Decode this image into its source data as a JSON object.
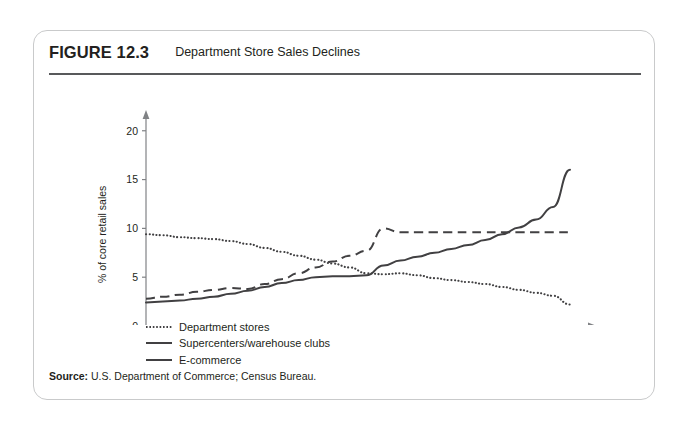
{
  "figure": {
    "number": "FIGURE 12.3",
    "title": "Department Store Sales Declines",
    "source_label": "Source:",
    "source_text": "U.S. Department of Commerce; Census Bureau."
  },
  "colors": {
    "line": "#414042",
    "axis": "#808285",
    "border": "#c9cacb",
    "rule": "#58595b",
    "text": "#231f20",
    "background": "#ffffff"
  },
  "legend": [
    {
      "label": "Department stores",
      "style": "dotted"
    },
    {
      "label": "Supercenters/warehouse clubs",
      "style": "dashed"
    },
    {
      "label": "E-commerce",
      "style": "solid"
    }
  ],
  "chart_data": {
    "type": "line",
    "title": "Department Store Sales Declines",
    "xlabel": "",
    "ylabel": "% of core retail sales",
    "xlim": [
      1995,
      2020
    ],
    "ylim": [
      0,
      21
    ],
    "xticks": [
      1995,
      2000,
      2005,
      2010,
      2015,
      2020
    ],
    "yticks": [
      0,
      5,
      10,
      15,
      20
    ],
    "grid": false,
    "legend_position": "below-left",
    "x": [
      1995,
      1996,
      1997,
      1998,
      1999,
      2000,
      2001,
      2002,
      2003,
      2004,
      2005,
      2006,
      2007,
      2008,
      2009,
      2010,
      2011,
      2012,
      2013,
      2014,
      2015,
      2016,
      2017,
      2018,
      2019,
      2020
    ],
    "series": [
      {
        "name": "Department stores",
        "style": "dotted",
        "values": [
          9.4,
          9.3,
          9.1,
          9.0,
          8.9,
          8.7,
          8.4,
          8.0,
          7.6,
          7.2,
          6.8,
          6.4,
          6.0,
          5.4,
          5.3,
          5.4,
          5.2,
          4.9,
          4.7,
          4.5,
          4.3,
          4.0,
          3.7,
          3.4,
          3.1,
          2.2
        ]
      },
      {
        "name": "Supercenters/warehouse clubs",
        "style": "dashed",
        "values": [
          2.8,
          3.0,
          3.2,
          3.5,
          3.7,
          3.9,
          3.8,
          4.3,
          4.8,
          5.4,
          6.0,
          6.6,
          7.2,
          7.7,
          10.0,
          9.6,
          9.6,
          9.6,
          9.6,
          9.6,
          9.6,
          9.6,
          9.6,
          9.6,
          9.6,
          9.6
        ]
      },
      {
        "name": "E-commerce",
        "style": "solid",
        "values": [
          2.4,
          2.5,
          2.6,
          2.8,
          3.0,
          3.3,
          3.6,
          4.0,
          4.4,
          4.7,
          5.0,
          5.1,
          5.1,
          5.2,
          6.2,
          6.7,
          7.1,
          7.5,
          7.9,
          8.3,
          8.8,
          9.4,
          10.1,
          10.9,
          12.2,
          16.0
        ]
      }
    ]
  }
}
